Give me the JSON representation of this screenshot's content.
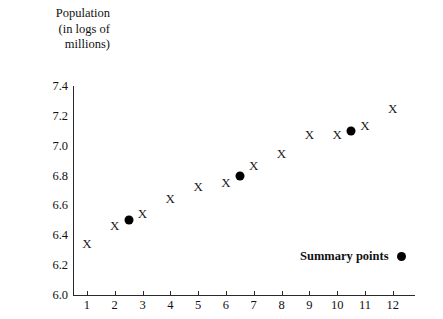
{
  "chart_data": {
    "type": "scatter",
    "title": "Population (in logs of millions)",
    "title_lines": [
      "Population",
      "(in logs of",
      "millions)"
    ],
    "xlabel": "",
    "ylabel": "Population (in logs of millions)",
    "xlim": [
      0.5,
      12.8
    ],
    "ylim": [
      6.0,
      7.4
    ],
    "grid": false,
    "x_ticks": [
      1,
      2,
      3,
      4,
      5,
      6,
      7,
      8,
      9,
      10,
      11,
      12
    ],
    "x_tick_labels": [
      "1",
      "2",
      "3",
      "4",
      "5",
      "6",
      "7",
      "8",
      "9",
      "10",
      "11",
      "12"
    ],
    "y_ticks": [
      6.0,
      6.2,
      6.4,
      6.6,
      6.8,
      7.0,
      7.2,
      7.4
    ],
    "y_tick_labels": [
      "6.0",
      "6.2",
      "6.4",
      "6.6",
      "6.8",
      "7.0",
      "7.2",
      "7.4"
    ],
    "series": [
      {
        "name": "Data points",
        "marker": "X",
        "color": "#1a1a1a",
        "x": [
          1,
          2,
          3,
          4,
          5,
          6,
          7,
          8,
          9,
          10,
          11,
          12
        ],
        "values": [
          6.35,
          6.47,
          6.55,
          6.65,
          6.73,
          6.76,
          6.87,
          6.95,
          7.08,
          7.08,
          7.14,
          7.25
        ]
      },
      {
        "name": "Summary points",
        "marker": "filled-circle",
        "color": "#000000",
        "x": [
          2.5,
          6.5,
          10.5
        ],
        "values": [
          6.5,
          6.8,
          7.1
        ]
      }
    ],
    "legend": {
      "position": "bottom-right",
      "entries": [
        {
          "label": "Summary points",
          "marker": "filled-circle",
          "color": "#000000"
        }
      ]
    }
  },
  "legend": {
    "summary_points_label": "Summary points"
  }
}
